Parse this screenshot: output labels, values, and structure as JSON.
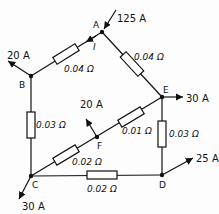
{
  "nodes": {
    "A": "A",
    "B": "B",
    "C": "C",
    "D": "D",
    "E": "E",
    "F": "F"
  },
  "currents": {
    "A_in": "125 A",
    "B_out": "20 A",
    "E_out": "30 A",
    "F_out": "20 A",
    "D_out": "25 A",
    "C_out": "30 A",
    "I": "I"
  },
  "resistors": {
    "AB": "0.04 Ω",
    "AE": "0.04 Ω",
    "BC": "0.03 Ω",
    "EF": "0.01 Ω",
    "FC": "0.02 Ω",
    "ED": "0.03 Ω",
    "CD": "0.02 Ω"
  }
}
